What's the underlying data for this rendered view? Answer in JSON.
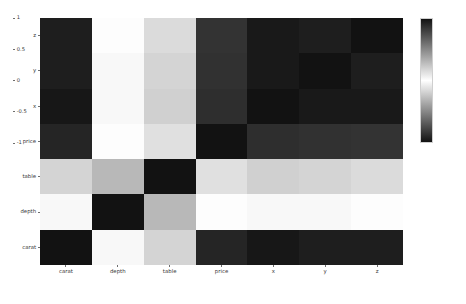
{
  "chart_data": {
    "type": "heatmap",
    "title": "",
    "subtitle": "",
    "xlabel": "",
    "ylabel": "",
    "grid": false,
    "legend_position": "right",
    "x_categories": [
      "carat",
      "depth",
      "table",
      "price",
      "x",
      "y",
      "z"
    ],
    "y_categories": [
      "z",
      "y",
      "x",
      "price",
      "table",
      "depth",
      "carat"
    ],
    "colormap": "diverging-gray (black at -1 and +1, white at 0)",
    "zlim": [
      -1,
      1
    ],
    "colorbar": {
      "ticks": [
        "1",
        "0.5",
        "0",
        "-0.5",
        "-1"
      ],
      "tick_values": [
        1,
        0.5,
        0,
        -0.5,
        -1
      ],
      "min_color": "#121212",
      "mid_color": "#ffffff",
      "max_color": "#121212"
    },
    "rows": [
      {
        "label": "z",
        "values": [
          0.95,
          0.01,
          0.15,
          0.86,
          0.97,
          0.95,
          1.0
        ]
      },
      {
        "label": "y",
        "values": [
          0.95,
          -0.03,
          0.18,
          0.87,
          0.97,
          1.0,
          0.95
        ]
      },
      {
        "label": "x",
        "values": [
          0.98,
          -0.03,
          0.2,
          0.88,
          1.0,
          0.97,
          0.97
        ]
      },
      {
        "label": "price",
        "values": [
          0.92,
          -0.01,
          0.13,
          1.0,
          0.88,
          0.87,
          0.86
        ]
      },
      {
        "label": "table",
        "values": [
          0.18,
          -0.3,
          1.0,
          0.13,
          0.2,
          0.18,
          0.15
        ]
      },
      {
        "label": "depth",
        "values": [
          0.03,
          1.0,
          -0.3,
          -0.01,
          -0.03,
          -0.03,
          0.01
        ]
      },
      {
        "label": "carat",
        "values": [
          1.0,
          0.03,
          0.18,
          0.92,
          0.98,
          0.95,
          0.95
        ]
      }
    ]
  },
  "axes": {
    "x_tick_labels": [
      "carat",
      "depth",
      "table",
      "price",
      "x",
      "y",
      "z"
    ],
    "y_tick_labels": [
      "z",
      "y",
      "x",
      "price",
      "table",
      "depth",
      "carat"
    ]
  },
  "legend": {
    "tick_labels": [
      "1",
      "0.5",
      "0",
      "-0.5",
      "-1"
    ]
  }
}
